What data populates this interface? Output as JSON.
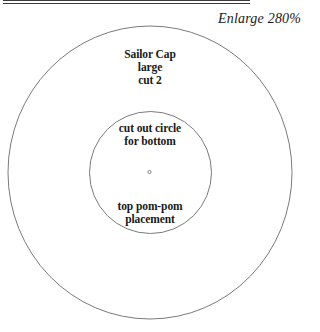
{
  "header": {
    "enlarge_label": "Enlarge 280%"
  },
  "pattern": {
    "title_lines": [
      "Sailor Cap",
      "large",
      "cut 2"
    ],
    "inner_circle_lines": [
      "cut out circle",
      "for bottom"
    ],
    "pompom_lines": [
      "top pom-pom",
      "placement"
    ],
    "outer_circle": {
      "cx": 150,
      "cy": 172.5,
      "rx": 142,
      "ry": 146.5
    },
    "inner_circle": {
      "cx": 150.5,
      "cy": 172.5,
      "r": 61
    },
    "center_mark": {
      "cx": 149.5,
      "cy": 172,
      "r": 1.6
    },
    "stroke_color": "#7a7a7a"
  }
}
